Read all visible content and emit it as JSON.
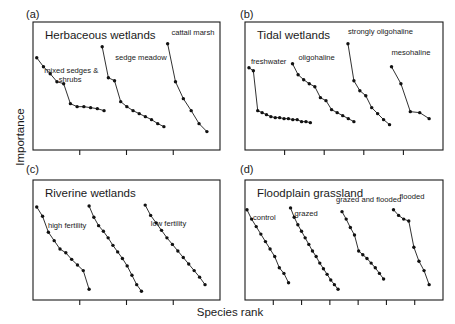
{
  "figure": {
    "xlabel": "Species rank",
    "ylabel": "Importance",
    "panel_labels": [
      "(a)",
      "(b)",
      "(c)",
      "(d)"
    ]
  },
  "chart_data": {
    "type": "line",
    "title": "",
    "xlabel": "Species rank",
    "ylabel": "Importance",
    "grid": false,
    "legend": "inline-annotations",
    "axis_ticks": "unlabeled",
    "panels": [
      {
        "id": "a",
        "label": "(a)",
        "title": "Herbaceous wetlands",
        "n_ticks": 3,
        "series": [
          {
            "name": "mixed sedges & shrubs",
            "label": "mixed sedges &\nshrubs",
            "points": [
              [
                0,
                86
              ],
              [
                1,
                77
              ],
              [
                2,
                70
              ],
              [
                3,
                62
              ],
              [
                4,
                60
              ],
              [
                5,
                40
              ],
              [
                6,
                37
              ],
              [
                7,
                37
              ],
              [
                8,
                36
              ],
              [
                9,
                35
              ],
              [
                10,
                33
              ]
            ]
          },
          {
            "name": "sedge meadow",
            "label": "sedge meadow",
            "points": [
              [
                0,
                97
              ],
              [
                1,
                66
              ],
              [
                2,
                63
              ],
              [
                3,
                42
              ],
              [
                4,
                37
              ],
              [
                5,
                33
              ],
              [
                6,
                30
              ],
              [
                7,
                27
              ],
              [
                8,
                24
              ],
              [
                9,
                20
              ],
              [
                10,
                17
              ]
            ]
          },
          {
            "name": "cattail marsh",
            "label": "cattail marsh",
            "points": [
              [
                0,
                100
              ],
              [
                1,
                62
              ],
              [
                2,
                45
              ],
              [
                3,
                33
              ],
              [
                4,
                20
              ],
              [
                5,
                12
              ]
            ]
          }
        ]
      },
      {
        "id": "b",
        "label": "(b)",
        "title": "Tidal wetlands",
        "n_ticks": 4,
        "series": [
          {
            "name": "freshwater",
            "label": "freshwater",
            "points": [
              [
                0,
                76
              ],
              [
                1,
                73
              ],
              [
                2,
                33
              ],
              [
                3,
                31
              ],
              [
                4,
                29
              ],
              [
                5,
                27
              ],
              [
                6,
                26
              ],
              [
                7,
                26
              ],
              [
                8,
                25
              ],
              [
                9,
                25
              ],
              [
                10,
                24
              ],
              [
                11,
                24
              ],
              [
                12,
                22
              ],
              [
                13,
                22
              ],
              [
                14,
                21
              ]
            ]
          },
          {
            "name": "oligohaline",
            "label": "oligohaline",
            "points": [
              [
                0,
                80
              ],
              [
                1,
                69
              ],
              [
                2,
                64
              ],
              [
                3,
                60
              ],
              [
                4,
                57
              ],
              [
                5,
                46
              ],
              [
                6,
                43
              ],
              [
                7,
                34
              ],
              [
                8,
                31
              ],
              [
                9,
                28
              ],
              [
                10,
                25
              ],
              [
                11,
                22
              ]
            ]
          },
          {
            "name": "strongly oligohaline",
            "label": "strongly oligohaline",
            "points": [
              [
                0,
                100
              ],
              [
                1,
                63
              ],
              [
                2,
                53
              ],
              [
                3,
                48
              ],
              [
                4,
                36
              ],
              [
                5,
                30
              ],
              [
                6,
                24
              ],
              [
                7,
                19
              ]
            ]
          },
          {
            "name": "mesohaline",
            "label": "mesohaline",
            "points": [
              [
                0,
                77
              ],
              [
                1,
                60
              ],
              [
                2,
                32
              ],
              [
                3,
                31
              ],
              [
                4,
                25
              ]
            ]
          }
        ]
      },
      {
        "id": "c",
        "label": "(c)",
        "title": "Riverine wetlands",
        "n_ticks": 3,
        "series": [
          {
            "name": "high fertility",
            "label": "high fertility",
            "points": [
              [
                0,
                93
              ],
              [
                1,
                83
              ],
              [
                2,
                66
              ],
              [
                3,
                57
              ],
              [
                4,
                48
              ],
              [
                5,
                44
              ],
              [
                6,
                37
              ],
              [
                7,
                31
              ],
              [
                8,
                25
              ],
              [
                9,
                5
              ]
            ]
          },
          {
            "name": "mid",
            "label": "",
            "points": [
              [
                0,
                94
              ],
              [
                1,
                82
              ],
              [
                2,
                73
              ],
              [
                3,
                67
              ],
              [
                4,
                60
              ],
              [
                5,
                52
              ],
              [
                6,
                45
              ],
              [
                7,
                38
              ],
              [
                8,
                30
              ],
              [
                9,
                20
              ],
              [
                10,
                10
              ],
              [
                11,
                3
              ]
            ]
          },
          {
            "name": "low fertility",
            "label": "low fertility",
            "points": [
              [
                0,
                95
              ],
              [
                1,
                84
              ],
              [
                2,
                76
              ],
              [
                3,
                68
              ],
              [
                4,
                60
              ],
              [
                5,
                53
              ],
              [
                6,
                46
              ],
              [
                7,
                39
              ],
              [
                8,
                32
              ],
              [
                9,
                25
              ],
              [
                10,
                18
              ],
              [
                11,
                10
              ]
            ]
          }
        ]
      },
      {
        "id": "d",
        "label": "(d)",
        "title": "Floodplain grassland",
        "n_ticks": 6,
        "series": [
          {
            "name": "control",
            "label": "control",
            "points": [
              [
                0,
                90
              ],
              [
                1,
                80
              ],
              [
                2,
                72
              ],
              [
                3,
                64
              ],
              [
                4,
                56
              ],
              [
                5,
                48
              ],
              [
                6,
                40
              ],
              [
                7,
                28
              ],
              [
                8,
                22
              ],
              [
                9,
                12
              ]
            ]
          },
          {
            "name": "grazed",
            "label": "grazed",
            "points": [
              [
                0,
                92
              ],
              [
                1,
                82
              ],
              [
                2,
                74
              ],
              [
                3,
                67
              ],
              [
                4,
                60
              ],
              [
                5,
                53
              ],
              [
                6,
                46
              ],
              [
                7,
                40
              ],
              [
                8,
                33
              ],
              [
                9,
                27
              ],
              [
                10,
                21
              ],
              [
                11,
                15
              ],
              [
                12,
                10
              ],
              [
                13,
                5
              ]
            ]
          },
          {
            "name": "grazed and flooded",
            "label": "grazed and flooded",
            "points": [
              [
                0,
                88
              ],
              [
                1,
                80
              ],
              [
                2,
                71
              ],
              [
                3,
                63
              ],
              [
                4,
                46
              ],
              [
                5,
                42
              ],
              [
                6,
                38
              ],
              [
                7,
                33
              ],
              [
                8,
                28
              ],
              [
                9,
                22
              ],
              [
                10,
                16
              ]
            ]
          },
          {
            "name": "flooded",
            "label": "flooded",
            "points": [
              [
                0,
                90
              ],
              [
                1,
                84
              ],
              [
                2,
                80
              ],
              [
                3,
                78
              ],
              [
                4,
                50
              ],
              [
                5,
                35
              ],
              [
                6,
                25
              ],
              [
                7,
                10
              ]
            ]
          }
        ]
      }
    ]
  }
}
